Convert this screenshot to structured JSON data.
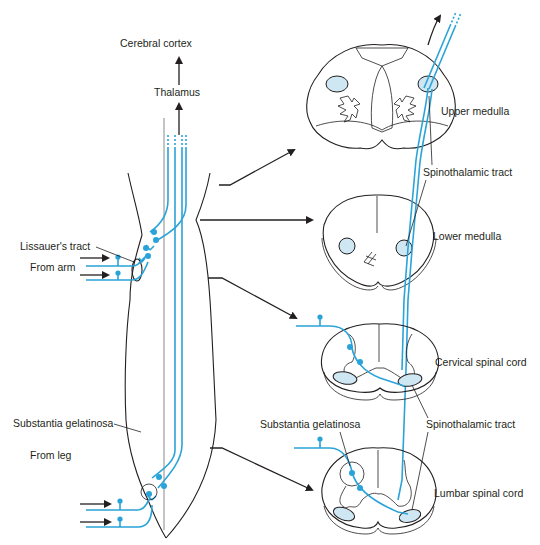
{
  "diagram": {
    "colors": {
      "pathway": "#2aa3d8",
      "tract_fill": "#cfe6f3",
      "outline": "#231f20"
    },
    "labels": {
      "cerebral_cortex": "Cerebral cortex",
      "thalamus": "Thalamus",
      "lissauers_tract": "Lissauer's tract",
      "from_arm": "From arm",
      "substantia_gelatinosa_left": "Substantia gelatinosa",
      "from_leg": "From leg",
      "upper_medulla": "Upper medulla",
      "spinothalamic_tract_upper": "Spinothalamic tract",
      "lower_medulla": "Lower medulla",
      "cervical_spinal_cord": "Cervical spinal cord",
      "spinothalamic_tract_lower": "Spinothalamic tract",
      "substantia_gelatinosa_right": "Substantia gelatinosa",
      "lumbar_spinal_cord": "Lumbar spinal cord"
    },
    "sections": [
      "Upper medulla",
      "Lower medulla",
      "Cervical spinal cord",
      "Lumbar spinal cord"
    ]
  }
}
